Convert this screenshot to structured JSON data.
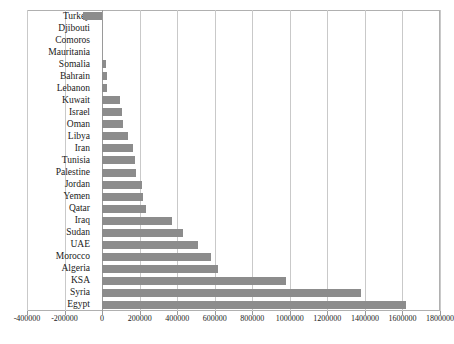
{
  "chart_data": {
    "type": "bar",
    "orientation": "horizontal",
    "title": "",
    "subtitle": "",
    "xlabel": "",
    "ylabel": "",
    "xlim": [
      -400000,
      1800000
    ],
    "grid": true,
    "legend": false,
    "legend_position": "none",
    "bar_color": "#8c8c8c",
    "gridline_color": "#c9c9c9",
    "axis_color": "#9a9a9a",
    "xticks": [
      "-400000",
      "-200000",
      "0",
      "200000",
      "400000",
      "600000",
      "800000",
      "1000000",
      "1200000",
      "1400000",
      "1600000",
      "1800000"
    ],
    "xtick_values": [
      -400000,
      -200000,
      0,
      200000,
      400000,
      600000,
      800000,
      1000000,
      1200000,
      1400000,
      1600000,
      1800000
    ],
    "categories": [
      "Turkey",
      "Djibouti",
      "Comoros",
      "Mauritania",
      "Somalia",
      "Bahrain",
      "Lebanon",
      "Kuwait",
      "Israel",
      "Oman",
      "Libya",
      "Iran",
      "Tunisia",
      "Palestine",
      "Jordan",
      "Yemen",
      "Qatar",
      "Iraq",
      "Sudan",
      "UAE",
      "Morocco",
      "Algeria",
      "KSA",
      "Syria",
      "Egypt"
    ],
    "values": [
      -100000,
      0,
      0,
      0,
      20000,
      25000,
      25000,
      95000,
      105000,
      110000,
      140000,
      165000,
      175000,
      180000,
      210000,
      220000,
      235000,
      375000,
      430000,
      510000,
      580000,
      620000,
      980000,
      1380000,
      1620000
    ]
  },
  "caption": {
    "text": ""
  }
}
